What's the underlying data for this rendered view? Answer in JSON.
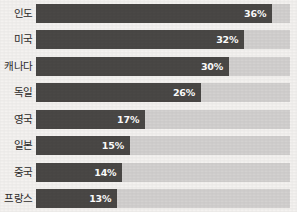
{
  "chart_data": {
    "type": "bar",
    "orientation": "horizontal",
    "title": "",
    "subtitle": "",
    "xlabel": "",
    "ylabel": "",
    "grid": false,
    "legend": null,
    "xlim": [
      0,
      40
    ],
    "axis_ticks": [],
    "value_suffix": "%",
    "track_max_percent": 40,
    "colors": {
      "bar": "#4a4846",
      "track": "#d3d1d0",
      "background": "#f4f2f0",
      "value_label": "#ffffff",
      "category_label": "#2d2b2a"
    },
    "categories": [
      "인도",
      "미국",
      "캐나다",
      "독일",
      "영국",
      "일본",
      "중국",
      "프랑스"
    ],
    "values": [
      36,
      32,
      30,
      26,
      17,
      15,
      14,
      13
    ],
    "data_labels": [
      "36%",
      "32%",
      "30%",
      "26%",
      "17%",
      "15%",
      "14%",
      "13%"
    ]
  },
  "rows": [
    {
      "category": "인도",
      "value": 36,
      "label": "36%",
      "fill_pct": 93
    },
    {
      "category": "미국",
      "value": 32,
      "label": "32%",
      "fill_pct": 82
    },
    {
      "category": "캐나다",
      "value": 30,
      "label": "30%",
      "fill_pct": 76
    },
    {
      "category": "독일",
      "value": 26,
      "label": "26%",
      "fill_pct": 65
    },
    {
      "category": "영국",
      "value": 17,
      "label": "17%",
      "fill_pct": 43
    },
    {
      "category": "일본",
      "value": 15,
      "label": "15%",
      "fill_pct": 37
    },
    {
      "category": "중국",
      "value": 14,
      "label": "14%",
      "fill_pct": 34
    },
    {
      "category": "프랑스",
      "value": 13,
      "label": "13%",
      "fill_pct": 32
    }
  ]
}
